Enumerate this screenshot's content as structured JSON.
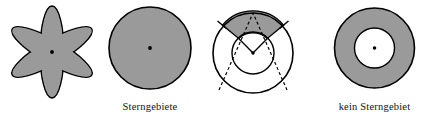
{
  "page": {
    "background_color": "#ffffff",
    "width": 439,
    "height": 120
  },
  "style": {
    "fill_gray": "#9a9a9a",
    "stroke_black": "#000000",
    "white": "#ffffff",
    "stroke_width": 1.4,
    "dash_pattern": "3,2.5"
  },
  "figures": [
    {
      "id": "star-flower",
      "name": "star-shaped-flower-region",
      "shape": "six-petal-star-region",
      "petal_count": 6,
      "filled": true,
      "center_dot": true,
      "caption": ""
    },
    {
      "id": "disk",
      "name": "filled-disk-region",
      "shape": "disk",
      "filled": true,
      "center_dot": true,
      "caption": "Sterngebiete"
    },
    {
      "id": "sector",
      "name": "annular-sector-construction",
      "shape": "two-circles-with-shaded-sector",
      "filled": false,
      "center_dot": true,
      "has_dashed_rays": true,
      "dashed_ray_count": 2,
      "caption": ""
    },
    {
      "id": "annulus",
      "name": "annulus-region",
      "shape": "annulus",
      "filled": true,
      "center_dot": true,
      "caption": "kein Sterngebiet"
    }
  ],
  "captions": {
    "sterngebiete": "Sterngebiete",
    "kein_sterngebiet": "kein Sterngebiet"
  }
}
